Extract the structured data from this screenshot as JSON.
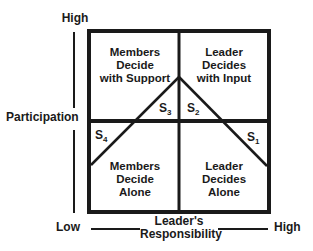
{
  "y_axis": {
    "title": "Participation",
    "high_label": "High",
    "low_label": "Low"
  },
  "x_axis": {
    "title_line1": "Leader's",
    "title_line2": "Responsibility",
    "low_label": "Low",
    "high_label": "High"
  },
  "quadrants": {
    "top_left": [
      "Members",
      "Decide",
      "with Support"
    ],
    "top_right": [
      "Leader",
      "Decides",
      "with Input"
    ],
    "bottom_left": [
      "Members",
      "Decide",
      "Alone"
    ],
    "bottom_right": [
      "Leader",
      "Decides",
      "Alone"
    ]
  },
  "styles": [
    {
      "letter": "S",
      "sub": "1"
    },
    {
      "letter": "S",
      "sub": "2"
    },
    {
      "letter": "S",
      "sub": "3"
    },
    {
      "letter": "S",
      "sub": "4"
    }
  ],
  "colors": {
    "line": "#1a1a1a",
    "background": "#ffffff"
  }
}
